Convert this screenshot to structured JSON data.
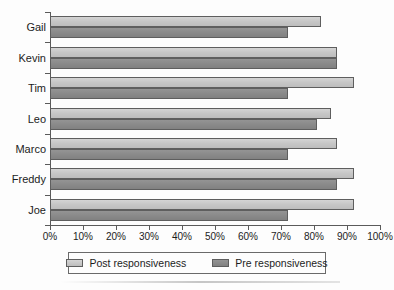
{
  "chart_data": {
    "type": "bar",
    "orientation": "horizontal",
    "title": "",
    "xlabel": "",
    "ylabel": "",
    "xlim": [
      0,
      100
    ],
    "xticks": [
      "0%",
      "10%",
      "20%",
      "30%",
      "40%",
      "50%",
      "60%",
      "70%",
      "80%",
      "90%",
      "100%"
    ],
    "xtick_values": [
      0,
      10,
      20,
      30,
      40,
      50,
      60,
      70,
      80,
      90,
      100
    ],
    "grid": false,
    "legend_position": "bottom",
    "categories": [
      "Gail",
      "Kevin",
      "Tim",
      "Leo",
      "Marco",
      "Freddy",
      "Joe"
    ],
    "series": [
      {
        "name": "Post responsiveness",
        "color": "#c8c8c8",
        "values": [
          82,
          87,
          92,
          85,
          87,
          92,
          92
        ]
      },
      {
        "name": "Pre responsiveness",
        "color": "#8a8a8a",
        "values": [
          72,
          87,
          72,
          81,
          72,
          87,
          72
        ]
      }
    ]
  },
  "legend": {
    "entries": [
      {
        "label": "Post responsiveness",
        "swatch": "post"
      },
      {
        "label": "Pre responsiveness",
        "swatch": "pre"
      }
    ]
  },
  "colors": {
    "post": "#c8c8c8",
    "pre": "#8a8a8a",
    "axis": "#5a5a5a",
    "text": "#1c1c1c",
    "background": "#fdfdfd"
  }
}
